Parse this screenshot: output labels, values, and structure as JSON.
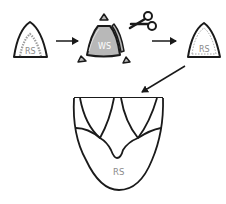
{
  "diagram": {
    "colors": {
      "stroke": "#1a1a1a",
      "ws_fill": "#b8b8b8",
      "dotted": "#9a9a9a",
      "label": "#8a8a8a",
      "background": "#ffffff"
    },
    "step1": {
      "label": "RS",
      "shape": "rounded-triangle-leaflet",
      "inner": "dotted-arc"
    },
    "arrow1": {
      "direction": "right",
      "icon": "arrow-right-icon"
    },
    "step2": {
      "label": "WS",
      "shape": "filled-rounded-triangle",
      "trim_pieces": 3,
      "tool": "scissors-icon"
    },
    "arrow2": {
      "direction": "right",
      "icon": "arrow-right-icon"
    },
    "step3": {
      "label": "RS",
      "shape": "rounded-triangle-leaflet",
      "inner": "dotted-outline"
    },
    "arrow3": {
      "direction": "down-left",
      "icon": "arrow-down-left-icon"
    },
    "result": {
      "label": "RS",
      "shape": "valve-cup-with-two-leaflets"
    }
  }
}
